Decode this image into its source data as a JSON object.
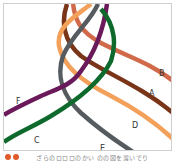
{
  "diagram": {
    "cords": [
      {
        "label": "A",
        "color": "#7a3518"
      },
      {
        "label": "B",
        "color": "#d06a4a"
      },
      {
        "label": "C",
        "color": "#0e6a2c"
      },
      {
        "label": "D",
        "color": "#f2a05a"
      },
      {
        "label": "E",
        "color": "#555b5e"
      },
      {
        "label": "F",
        "color": "#6a1a5a"
      }
    ],
    "labels": {
      "A": "A",
      "B": "B",
      "C": "C",
      "D": "D",
      "E": "E",
      "F": "F"
    }
  },
  "caption": {
    "marker_color": "#e05a2a",
    "text": "ざらのロロロのかい のの図を渡いでり"
  }
}
